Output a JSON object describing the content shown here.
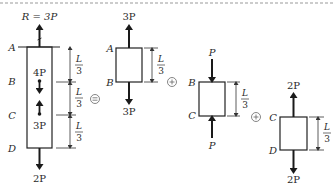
{
  "diagram": {
    "main_bar": {
      "points": [
        "A",
        "B",
        "C",
        "D"
      ],
      "reaction_label": "R = 3P",
      "internal_load_top": "4P",
      "internal_load_bottom": "3P",
      "bottom_load": "2P",
      "segment_lengths": [
        {
          "num": "L",
          "den": "3"
        },
        {
          "num": "L",
          "den": "3"
        },
        {
          "num": "L",
          "den": "3"
        }
      ]
    },
    "equals_symbol": "=",
    "plus_symbol": "+",
    "segments": [
      {
        "top_point": "A",
        "bottom_point": "B",
        "top_load": "3P",
        "bottom_load": "3P",
        "length": {
          "num": "L",
          "den": "3"
        },
        "type": "tension"
      },
      {
        "top_point": "B",
        "bottom_point": "C",
        "top_load": "P",
        "bottom_load": "P",
        "length": {
          "num": "L",
          "den": "3"
        },
        "type": "compression"
      },
      {
        "top_point": "C",
        "bottom_point": "D",
        "top_load": "2P",
        "bottom_load": "2P",
        "length": {
          "num": "L",
          "den": "3"
        },
        "type": "tension"
      }
    ]
  }
}
